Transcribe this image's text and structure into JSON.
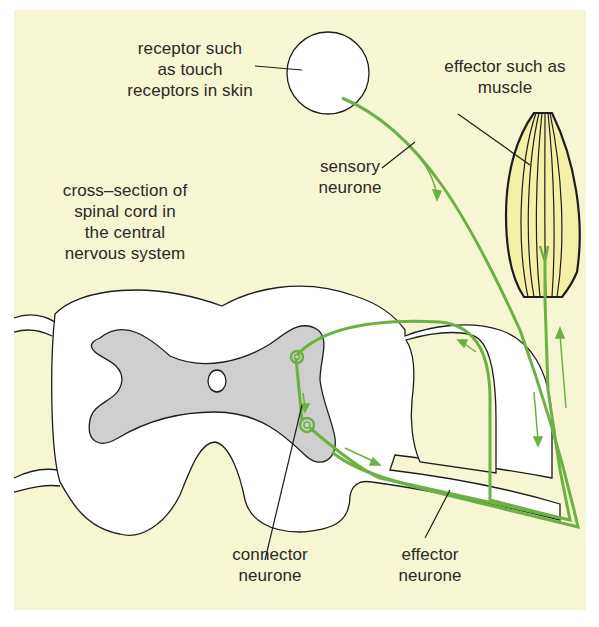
{
  "diagram": {
    "colors": {
      "background": "#f7f6d2",
      "neurone": "#6db043",
      "grey_matter": "#cfcfcf",
      "white_matter": "#ffffff",
      "muscle_fill": "#f4f0a8",
      "outline": "#1e1e1e",
      "text": "#2a2a2a"
    },
    "labels": {
      "receptor": {
        "lines": [
          "receptor such",
          "as touch",
          "receptors in skin"
        ]
      },
      "effector": {
        "lines": [
          "effector such as",
          "muscle"
        ]
      },
      "sensory": {
        "lines": [
          "sensory",
          "neurone"
        ]
      },
      "spinal_cord": {
        "lines": [
          "cross–section of",
          "spinal cord in",
          "the central",
          "nervous system"
        ]
      },
      "connector": {
        "lines": [
          "connector",
          "neurone"
        ]
      },
      "effector_neurone": {
        "lines": [
          "effector",
          "neurone"
        ]
      }
    },
    "components": [
      {
        "name": "receptor",
        "shape": "circle"
      },
      {
        "name": "effector-muscle",
        "shape": "spindle"
      },
      {
        "name": "sensory-neurone",
        "shape": "line"
      },
      {
        "name": "connector-neurone",
        "shape": "line"
      },
      {
        "name": "effector-neurone",
        "shape": "line"
      },
      {
        "name": "spinal-cord-cross-section",
        "shape": "blob"
      },
      {
        "name": "grey-matter",
        "shape": "butterfly"
      },
      {
        "name": "central-canal",
        "shape": "ellipse"
      }
    ]
  }
}
